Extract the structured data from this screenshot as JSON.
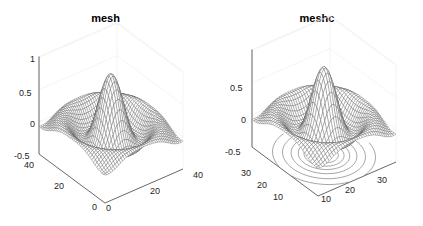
{
  "chart_data": [
    {
      "type": "surface-mesh",
      "title": "mesh",
      "function": "z = sin(r)/r, r = sqrt(x^2 + y^2) (sombrero)",
      "x_ticks": [
        "0",
        "20",
        "40"
      ],
      "y_ticks": [
        "0",
        "20",
        "40"
      ],
      "z_ticks": [
        "-0.5",
        "0",
        "0.5",
        "1"
      ],
      "xlim": [
        0,
        40
      ],
      "ylim": [
        0,
        40
      ],
      "zlim": [
        -0.5,
        1
      ],
      "grid_size": 40,
      "grid": false,
      "view": "3D default (az -37.5, el 30)",
      "edge_color": "#555555",
      "face_color": "#ffffff",
      "contours_below": false
    },
    {
      "type": "surface-mesh-contour",
      "title": "meshc",
      "function": "z = sin(r)/r, r = sqrt(x^2 + y^2) (sombrero)",
      "x_ticks": [
        "10",
        "20",
        "30"
      ],
      "y_ticks": [
        "10",
        "20",
        "30"
      ],
      "z_ticks": [
        "-0.5",
        "0",
        "0.5"
      ],
      "xlim": [
        0,
        40
      ],
      "ylim": [
        0,
        40
      ],
      "zlim": [
        -0.5,
        1
      ],
      "grid_size": 35,
      "grid": false,
      "view": "3D default (az -37.5, el 30)",
      "edge_color": "#555555",
      "face_color": "#ffffff",
      "contours_below": true,
      "contour_levels": 7
    }
  ],
  "panels": {
    "left": {
      "title": "mesh",
      "z_ticks": [
        {
          "label": "1",
          "x": 30,
          "y": 59
        },
        {
          "label": "0.5",
          "x": 19,
          "y": 93
        },
        {
          "label": "0",
          "x": 30,
          "y": 124
        },
        {
          "label": "-0.5",
          "x": 14,
          "y": 156
        }
      ],
      "y_ticks": [
        {
          "label": "40",
          "x": 24,
          "y": 165
        },
        {
          "label": "20",
          "x": 54,
          "y": 186
        },
        {
          "label": "0",
          "x": 92,
          "y": 207
        }
      ],
      "x_ticks": [
        {
          "label": "0",
          "x": 106,
          "y": 208
        },
        {
          "label": "20",
          "x": 150,
          "y": 191
        },
        {
          "label": "40",
          "x": 193,
          "y": 175
        }
      ]
    },
    "right": {
      "title": "meshc",
      "z_ticks": [
        {
          "label": "0.5",
          "x": 19,
          "y": 88
        },
        {
          "label": "0",
          "x": 30,
          "y": 120
        },
        {
          "label": "-0.5",
          "x": 14,
          "y": 152
        }
      ],
      "y_ticks": [
        {
          "label": "30",
          "x": 30,
          "y": 173
        },
        {
          "label": "20",
          "x": 46,
          "y": 185
        },
        {
          "label": "10",
          "x": 62,
          "y": 197
        }
      ],
      "x_ticks": [
        {
          "label": "10",
          "x": 110,
          "y": 199
        },
        {
          "label": "20",
          "x": 134,
          "y": 190
        },
        {
          "label": "30",
          "x": 166,
          "y": 180
        }
      ]
    }
  }
}
